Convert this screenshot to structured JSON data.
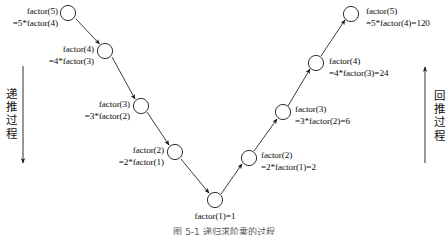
{
  "figure": {
    "caption": "图 5-1  递归求阶乘的过程",
    "line_color": "#1a1a1a",
    "node_fill": "#ffffff",
    "node_stroke": "#1a1a1a"
  },
  "descent": {
    "axis_label_chars": [
      "递",
      "推",
      "过",
      "程"
    ],
    "axis_label": "递推过程",
    "arrow_direction": "down",
    "nodes": [
      {
        "line1": "factor(5)",
        "line2": "=5*factor(4)"
      },
      {
        "line1": "factor(4)",
        "line2": "=4*factor(3)"
      },
      {
        "line1": "factor(3)",
        "line2": "=3*factor(2)"
      },
      {
        "line1": "factor(2)",
        "line2": "=2*factor(1)"
      }
    ]
  },
  "base_case": {
    "label": "factor(1)=1"
  },
  "backtrack": {
    "axis_label_chars": [
      "回",
      "推",
      "过",
      "程"
    ],
    "axis_label": "回推过程",
    "arrow_direction": "up",
    "nodes": [
      {
        "line1": "factor(2)",
        "line2": "=2*factor(1)=2"
      },
      {
        "line1": "factor(3)",
        "line2": "=3*factor(2)=6"
      },
      {
        "line1": "factor(4)",
        "line2": "=4*factor(3)=24"
      },
      {
        "line1": "factor(5)",
        "line2": "=5*factor(4)=120"
      }
    ]
  }
}
